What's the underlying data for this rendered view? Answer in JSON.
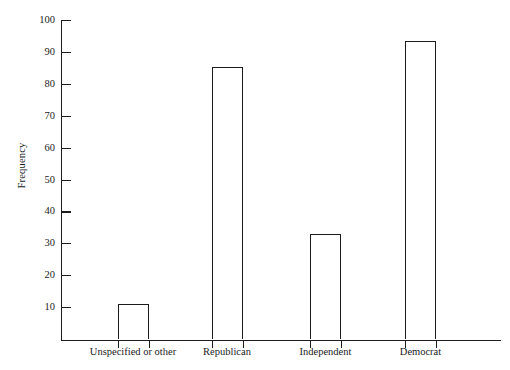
{
  "chart_data": {
    "type": "bar",
    "title": "",
    "subtitle": "",
    "xlabel": "",
    "ylabel": "Frequency",
    "categories": [
      "Unspecified or other",
      "Republican",
      "Independent",
      "Democrat"
    ],
    "values": [
      11,
      85.5,
      33,
      93.5
    ],
    "series": [
      {
        "name": "Frequency",
        "values": [
          11,
          85.5,
          33,
          93.5
        ]
      }
    ],
    "ylim": [
      0,
      100
    ],
    "y_ticks": [
      10,
      20,
      30,
      40,
      50,
      60,
      70,
      80,
      90,
      100
    ],
    "y_tick_labels": [
      "10",
      "20",
      "30",
      "40",
      "50",
      "60",
      "70",
      "80",
      "90",
      "100"
    ],
    "grid": false,
    "legend": false,
    "legend_position": "none",
    "annotations": [],
    "colors": {
      "bar_fill": "#ffffff",
      "bar_outline": "#1b1b1b",
      "axis": "#1c1c1c",
      "text": "#1a1a1a",
      "background": "#ffffff"
    }
  }
}
